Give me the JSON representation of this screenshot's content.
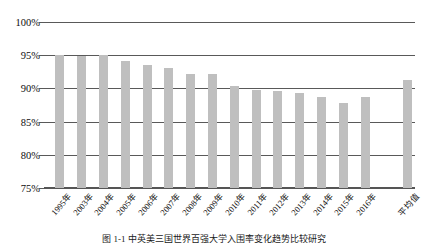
{
  "chart_data": {
    "type": "bar",
    "title": "",
    "subtitle": "",
    "xlabel": "",
    "ylabel": "",
    "ylim": [
      75,
      100
    ],
    "ytick_labels": [
      "100%",
      "95%",
      "90%",
      "85%",
      "80%",
      "75%"
    ],
    "ytick_values": [
      100,
      95,
      90,
      85,
      80,
      75
    ],
    "grid": true,
    "legend": "none",
    "bar_color": "#bfbfbf",
    "axis_color": "#595959",
    "categories": [
      "1995年",
      "2003年",
      "2004年",
      "2005年",
      "2006年",
      "2007年",
      "2008年",
      "2009年",
      "2010年",
      "2011年",
      "2012年",
      "2013年",
      "2014年",
      "2015年",
      "2016年",
      "平均值"
    ],
    "values": [
      95.0,
      94.9,
      95.0,
      94.2,
      93.5,
      93.0,
      92.2,
      92.2,
      90.3,
      89.8,
      89.6,
      89.3,
      88.7,
      87.8,
      88.7,
      91.3
    ],
    "series": [
      {
        "name": "比率",
        "values": [
          95.0,
          94.9,
          95.0,
          94.2,
          93.5,
          93.0,
          92.2,
          92.2,
          90.3,
          89.8,
          89.6,
          89.3,
          88.7,
          87.8,
          88.7,
          91.3
        ]
      }
    ]
  },
  "figure": {
    "caption": "图 1-1  中英美三国世界百强大学入围率变化趋势比较研究"
  }
}
